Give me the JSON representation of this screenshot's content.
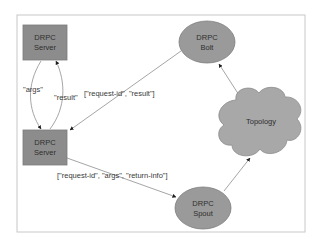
{
  "diagram": {
    "colors": {
      "frame_border": "#c8c8c8",
      "server_fill": "#8c8c8c",
      "server_stroke": "#7a7a7a",
      "ellipse_fill": "#9a9a9a",
      "ellipse_stroke": "#7d7d7d",
      "cloud_fill": "#a8a8a8",
      "cloud_stroke": "#8a8a8a",
      "edge": "#8e8e8e",
      "arrowhead": "#1e1e1e"
    },
    "nodes": {
      "drpc_server_top": {
        "line1": "DRPC",
        "line2": "Server",
        "shape": "rectangle"
      },
      "drpc_server_bottom": {
        "line1": "DRPC",
        "line2": "Server",
        "shape": "rectangle"
      },
      "drpc_bolt": {
        "line1": "DRPC",
        "line2": "Bolt",
        "shape": "ellipse"
      },
      "topology": {
        "label": "Topology",
        "shape": "cloud"
      },
      "drpc_spout": {
        "line1": "DRPC",
        "line2": "Spout",
        "shape": "ellipse"
      }
    },
    "edges": {
      "args": {
        "label": "\"args\"",
        "from": "DRPC Server (top)",
        "to": "DRPC Server (bottom)"
      },
      "result": {
        "label": "\"result\"",
        "from": "DRPC Server (bottom)",
        "to": "DRPC Server (top)"
      },
      "bolt_to_server": {
        "label": "[\"request-id\", \"result\"]",
        "from": "DRPC Bolt",
        "to": "DRPC Server (bottom)"
      },
      "server_to_spout": {
        "label": "[\"request-id\", \"args\", \"return-info\"]",
        "from": "DRPC Server (bottom)",
        "to": "DRPC Spout"
      },
      "spout_to_topology": {
        "label": "",
        "from": "DRPC Spout",
        "to": "Topology"
      },
      "topology_to_bolt": {
        "label": "",
        "from": "Topology",
        "to": "DRPC Bolt"
      }
    }
  }
}
